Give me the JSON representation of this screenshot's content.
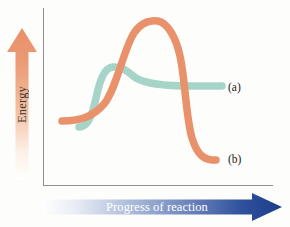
{
  "figure": {
    "type": "energy-diagram",
    "background_color": "#fdfdfc"
  },
  "axes": {
    "y": {
      "label": "Energy",
      "arrow_direction": "up",
      "arrow_color_light": "#fbe7d8",
      "arrow_color_dark": "#e8916a",
      "line_color": "#8e9093"
    },
    "x": {
      "label": "Progress of reaction",
      "arrow_direction": "right",
      "arrow_color_light": "#ffffff",
      "arrow_color_dark": "#1d3f8a",
      "label_color": "#ffffff",
      "line_color": "#8e9093"
    }
  },
  "curves": [
    {
      "id": "curve-a",
      "label": "(a)",
      "color": "#a6d4c9",
      "description": "catalyzed reaction pathway - lower activation energy barrier, products at moderate energy",
      "path": "M 79 127 C 88 127, 92 116, 96 98 C 100 80, 104 68, 113 67 C 122 66, 128 72, 136 78 C 146 84, 165 86, 190 86 L 222 86"
    },
    {
      "id": "curve-b",
      "label": "(b)",
      "color": "#e8916a",
      "description": "uncatalyzed reaction pathway - higher activation energy barrier, products at low energy",
      "path": "M 62 121 C 78 121, 92 118, 104 104 C 116 90, 124 48, 134 33 C 142 21, 152 20, 158 21 C 168 23, 176 38, 180 56 C 185 78, 186 118, 192 138 C 197 154, 203 159, 212 160 L 216 160"
    }
  ],
  "labels": {
    "a": "(a)",
    "b": "(b)"
  },
  "chart_data": {
    "type": "line",
    "title": "",
    "xlabel": "Progress of reaction",
    "ylabel": "Energy",
    "grid": false,
    "legend_position": "right-inline",
    "axis_ticks": [],
    "series": [
      {
        "name": "(a)",
        "color": "#a6d4c9",
        "points": [
          {
            "x": 0.16,
            "y": 0.36
          },
          {
            "x": 0.24,
            "y": 0.52
          },
          {
            "x": 0.31,
            "y": 0.66
          },
          {
            "x": 0.38,
            "y": 0.66
          },
          {
            "x": 0.47,
            "y": 0.6
          },
          {
            "x": 0.64,
            "y": 0.56
          },
          {
            "x": 0.82,
            "y": 0.56
          },
          {
            "x": 1.0,
            "y": 0.56
          }
        ]
      },
      {
        "name": "(b)",
        "color": "#e8916a",
        "points": [
          {
            "x": 0.0,
            "y": 0.39
          },
          {
            "x": 0.13,
            "y": 0.4
          },
          {
            "x": 0.27,
            "y": 0.52
          },
          {
            "x": 0.4,
            "y": 0.78
          },
          {
            "x": 0.52,
            "y": 0.92
          },
          {
            "x": 0.62,
            "y": 0.92
          },
          {
            "x": 0.72,
            "y": 0.75
          },
          {
            "x": 0.81,
            "y": 0.47
          },
          {
            "x": 0.9,
            "y": 0.26
          },
          {
            "x": 1.0,
            "y": 0.2
          }
        ]
      }
    ]
  }
}
